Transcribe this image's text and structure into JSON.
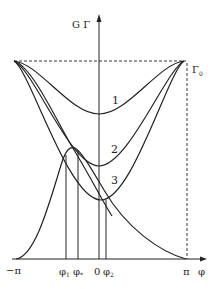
{
  "diagram": {
    "y_axis_label": "G Γ",
    "x_axis_label": "φ",
    "gamma0_label": "Γ",
    "gamma0_subscript": "0",
    "x_ticks": [
      {
        "label": "−π",
        "x": 16
      },
      {
        "label": "φ",
        "sub": "1",
        "x": 66
      },
      {
        "label": "φ",
        "sub": "*",
        "x": 78
      },
      {
        "label": "0",
        "x": 99
      },
      {
        "label": "φ",
        "sub": "2",
        "x": 106
      },
      {
        "label": "π",
        "x": 186
      }
    ],
    "curve_labels": [
      "1",
      "2",
      "3"
    ],
    "colors": {
      "ink": "#222222",
      "background": "#ffffff"
    }
  }
}
